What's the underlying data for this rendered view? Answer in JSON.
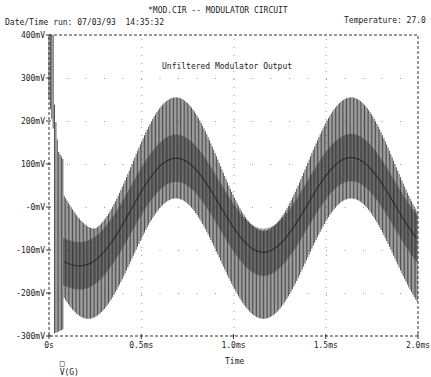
{
  "header": {
    "circuit_title": "*MOD.CIR -- MODULATOR CIRCUIT",
    "date_time": "Date/Time run: 07/03/93  14:35:32",
    "temperature": "Temperature: 27.0"
  },
  "plot": {
    "inner_title": "Unfiltered Modulator Output",
    "legend_marker": "□",
    "legend_label": "V(G)",
    "x_axis_label": "Time"
  },
  "chart_data": {
    "type": "line",
    "title": "Unfiltered Modulator Output",
    "xlabel": "Time",
    "ylabel": "",
    "x_ticks": [
      "0s",
      "0.5ms",
      "1.0ms",
      "1.5ms",
      "2.0ms"
    ],
    "y_ticks": [
      "400mV",
      "300mV",
      "200mV",
      "100mV",
      "-0mV",
      "-100mV",
      "-200mV",
      "-300mV"
    ],
    "xlim_ms": [
      0,
      2.0
    ],
    "ylim_mV": [
      -300,
      400
    ],
    "grid": "dotted",
    "legend": [
      {
        "marker": "square",
        "label": "V(G)"
      }
    ],
    "series": [
      {
        "name": "V(G)",
        "description": "High-frequency square-wave carrier modulated by ~1.5kHz sine; starts near 400mV then settles",
        "envelope_upper_mV": {
          "x_ms": [
            0,
            0.05,
            0.2,
            0.4,
            0.7,
            1.0,
            1.3,
            1.6,
            1.9,
            2.0
          ],
          "y": [
            400,
            130,
            20,
            160,
            255,
            100,
            -50,
            255,
            120,
            60
          ]
        },
        "center_mV": {
          "x_ms": [
            0,
            0.2,
            0.4,
            0.7,
            1.0,
            1.3,
            1.6,
            1.9,
            2.0
          ],
          "y": [
            380,
            -100,
            0,
            110,
            0,
            -110,
            120,
            60,
            20
          ]
        },
        "envelope_lower_mV": {
          "x_ms": [
            0,
            0.2,
            0.4,
            0.7,
            1.0,
            1.3,
            1.6,
            1.9,
            2.0
          ],
          "y": [
            -300,
            -260,
            -150,
            -20,
            -150,
            -265,
            -100,
            10,
            -20
          ]
        }
      }
    ]
  }
}
